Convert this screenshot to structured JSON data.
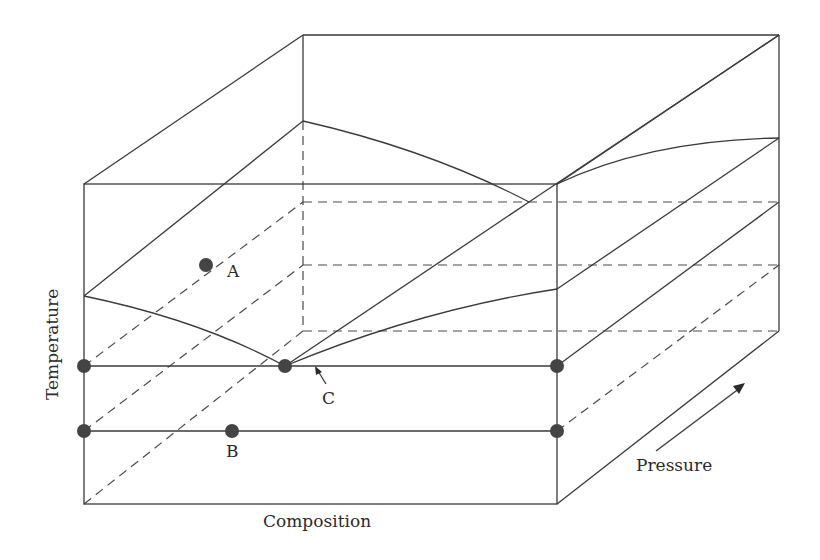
{
  "diagram": {
    "title": "",
    "type": "3D phase diagram (temperature-composition-pressure prism)",
    "axes": {
      "x_label": "Composition",
      "y_label": "Temperature",
      "z_label": "Pressure"
    },
    "points": [
      {
        "id": "A",
        "label": "A"
      },
      {
        "id": "B",
        "label": "B"
      },
      {
        "id": "C",
        "label": "C"
      }
    ],
    "colors": {
      "line": "#3a3a3a",
      "point": "#444444",
      "background": "#ffffff"
    }
  }
}
